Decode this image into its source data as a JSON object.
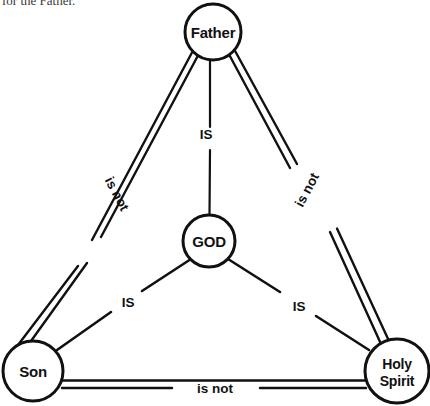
{
  "page": {
    "text_fragment": "for the Father.",
    "background_color": "#ffffff",
    "ink_color": "#111111"
  },
  "diagram": {
    "name": "shield-of-the-trinity",
    "nodes": [
      {
        "id": "father",
        "label": "Father",
        "label_line_1": "Father",
        "label_line_2": "",
        "cx": 213,
        "cy": 32,
        "r": 28
      },
      {
        "id": "son",
        "label": "Son",
        "label_line_1": "Son",
        "label_line_2": "",
        "cx": 33,
        "cy": 371,
        "r": 30
      },
      {
        "id": "holy-spirit",
        "label": "Holy Spirit",
        "label_line_1": "Holy",
        "label_line_2": "Spirit",
        "cx": 397,
        "cy": 371,
        "r": 32
      },
      {
        "id": "god",
        "label": "GOD",
        "label_line_1": "GOD",
        "label_line_2": "",
        "cx": 209,
        "cy": 241,
        "r": 26
      }
    ],
    "outer_edges": [
      {
        "id": "father-son",
        "from": "father",
        "to": "son",
        "label": "is not",
        "style": "double",
        "label_x": 113,
        "label_y": 196,
        "label_rotation": 62
      },
      {
        "id": "father-holyspirit",
        "from": "father",
        "to": "holy-spirit",
        "label": "is not",
        "style": "double",
        "label_x": 311,
        "label_y": 192,
        "label_rotation": -62
      },
      {
        "id": "son-holyspirit",
        "from": "son",
        "to": "holy-spirit",
        "label": "is not",
        "style": "double",
        "label_x": 215,
        "label_y": 389,
        "label_rotation": 0
      }
    ],
    "inner_edges": [
      {
        "id": "god-father",
        "from": "god",
        "to": "father",
        "label": "IS",
        "style": "single",
        "label_x": 206,
        "label_y": 139,
        "label_rotation": 0
      },
      {
        "id": "god-son",
        "from": "god",
        "to": "son",
        "label": "IS",
        "style": "single",
        "label_x": 128,
        "label_y": 307,
        "label_rotation": 0
      },
      {
        "id": "god-holyspirit",
        "from": "god",
        "to": "holy-spirit",
        "label": "IS",
        "style": "single",
        "label_x": 299,
        "label_y": 311,
        "label_rotation": 0
      }
    ]
  }
}
